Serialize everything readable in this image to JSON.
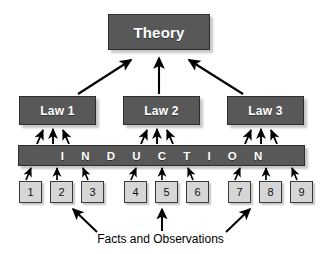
{
  "diagram": {
    "background_color": "#ffffff",
    "box_fill_color": "#585858",
    "box_border_color": "#2e2e2e",
    "box_text_color": "#ffffff",
    "numbox_fill_color": "#d6d6d6",
    "numbox_border_color": "#3a3a3a",
    "arrow_color": "#000000"
  },
  "theory": {
    "label": "Theory"
  },
  "laws": [
    {
      "label": "Law 1"
    },
    {
      "label": "Law 2"
    },
    {
      "label": "Law 3"
    }
  ],
  "induction": {
    "label": "I N D U C T I O N",
    "plain_label": "INDUCTION"
  },
  "facts": [
    {
      "label": "1"
    },
    {
      "label": "2"
    },
    {
      "label": "3"
    },
    {
      "label": "4"
    },
    {
      "label": "5"
    },
    {
      "label": "6"
    },
    {
      "label": "7"
    },
    {
      "label": "8"
    },
    {
      "label": "9"
    }
  ],
  "caption": {
    "label": "Facts and Observations"
  }
}
